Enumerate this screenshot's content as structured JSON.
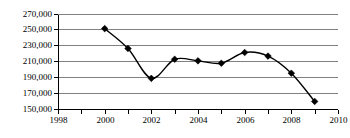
{
  "chart_data": {
    "type": "line",
    "title": "",
    "subtitle": "",
    "xlabel": "",
    "ylabel": "",
    "x": [
      2000,
      2001,
      2002,
      2003,
      2004,
      2005,
      2006,
      2007,
      2008,
      2009
    ],
    "values": [
      251000,
      226000,
      188500,
      212500,
      210500,
      207500,
      221000,
      216500,
      195000,
      159500
    ],
    "series": [
      {
        "name": "series-1",
        "marker": "diamond",
        "color": "#000000",
        "values": [
          251000,
          226000,
          188500,
          212500,
          210500,
          207500,
          221000,
          216500,
          195000,
          159500
        ]
      }
    ],
    "xlim": [
      1998,
      2010
    ],
    "ylim": [
      150000,
      270000
    ],
    "xticks": [
      1998,
      1999,
      2000,
      2001,
      2002,
      2003,
      2004,
      2005,
      2006,
      2007,
      2008,
      2009,
      2010
    ],
    "xtick_labels": [
      "1998",
      "",
      "2000",
      "",
      "2002",
      "",
      "2004",
      "",
      "2006",
      "",
      "2008",
      "",
      "2010"
    ],
    "yticks": [
      150000,
      170000,
      190000,
      210000,
      230000,
      250000,
      270000
    ],
    "ytick_labels": [
      "150,000",
      "170,000",
      "190,000",
      "210,000",
      "230,000",
      "250,000",
      "270,000"
    ],
    "grid": "horizontal",
    "grid_color": "#808080",
    "legend": "none",
    "legend_position": "none",
    "annotations": []
  }
}
